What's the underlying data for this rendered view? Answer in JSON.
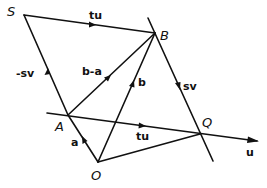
{
  "diagram": {
    "points": {
      "S": {
        "label": "S",
        "x": 24,
        "y": 15
      },
      "B": {
        "label": "B",
        "x": 155,
        "y": 33
      },
      "A": {
        "label": "A",
        "x": 68,
        "y": 115
      },
      "O": {
        "label": "O",
        "x": 98,
        "y": 162
      },
      "Q": {
        "label": "Q",
        "x": 200,
        "y": 134
      }
    },
    "vector_labels": {
      "SB": "tu",
      "AS": "-sv",
      "AB": "b-a",
      "OB": "b",
      "BQ": "sv",
      "AQ": "tu",
      "OA": "a",
      "u_axis": "u"
    }
  }
}
